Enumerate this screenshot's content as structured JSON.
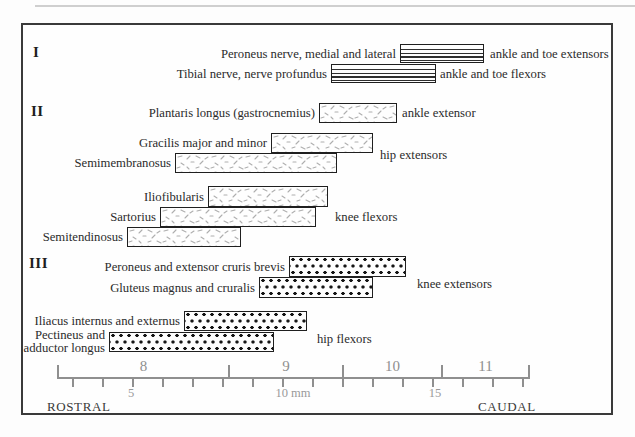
{
  "figure": {
    "frame": {
      "x": 21,
      "y": 23,
      "w": 592,
      "h": 392
    },
    "colors": {
      "frame_border": "#3a3a3a",
      "bar_border": "#1f1f1f",
      "stripe_line": "#2f2f2f",
      "speckle_stroke": "#aeaeae",
      "dot_fill": "#161616",
      "axis_gray": "#8f8f8f",
      "text": "#2b2b2b"
    }
  },
  "chart_data": {
    "type": "bar",
    "orientation": "horizontal-span",
    "title": "",
    "xlabel": "mm",
    "axis": {
      "unit": "mm",
      "mm_start": 3,
      "mm_end": 18,
      "px_origin_x": 73,
      "px_per_mm": 30,
      "line_y": 378,
      "minor_tick_step_mm": 1,
      "mm_labels": [
        {
          "text": "5",
          "mm": 5,
          "dx": -2
        },
        {
          "text": "10 mm",
          "mm": 10,
          "dx": 10
        },
        {
          "text": "15",
          "mm": 15,
          "dx": 2
        }
      ],
      "segment_boundaries_mm": [
        2.5,
        8.2,
        12.0,
        15.3,
        18.2
      ],
      "segment_labels": [
        "8",
        "9",
        "10",
        "11"
      ],
      "rostral_label": "ROSTRAL",
      "caudal_label": "CAUDAL",
      "rostral_x": 47,
      "caudal_x": 478,
      "end_label_y": 399
    },
    "groups": [
      {
        "numeral": "I",
        "pattern": "stripes",
        "x": 33,
        "y": 52
      },
      {
        "numeral": "II",
        "pattern": "speckle",
        "x": 31,
        "y": 111
      },
      {
        "numeral": "III",
        "pattern": "dots",
        "x": 29,
        "y": 263
      }
    ],
    "bars": [
      {
        "label": "Peroneus nerve, medial and lateral",
        "group": "I",
        "start_mm": 13.9,
        "end_mm": 16.7,
        "y": 44,
        "h": 19
      },
      {
        "label": "Tibial nerve, nerve profundus",
        "group": "I",
        "start_mm": 11.6,
        "end_mm": 15.1,
        "y": 64,
        "h": 19
      },
      {
        "label": "Plantaris longus (gastrocnemius)",
        "group": "II",
        "start_mm": 11.2,
        "end_mm": 13.8,
        "y": 103,
        "h": 20
      },
      {
        "label": "Gracilis major and minor",
        "group": "II",
        "start_mm": 9.6,
        "end_mm": 13.0,
        "y": 133,
        "h": 20
      },
      {
        "label": "Semimembranosus",
        "group": "II",
        "start_mm": 6.4,
        "end_mm": 11.8,
        "y": 153,
        "h": 20
      },
      {
        "label": "Iliofibularis",
        "group": "II",
        "start_mm": 7.5,
        "end_mm": 11.5,
        "y": 186,
        "h": 21
      },
      {
        "label": "Sartorius",
        "group": "II",
        "start_mm": 5.9,
        "end_mm": 11.1,
        "y": 207,
        "h": 20
      },
      {
        "label": "Semitendinosus",
        "group": "II",
        "start_mm": 4.8,
        "end_mm": 8.6,
        "y": 227,
        "h": 20
      },
      {
        "label": "Peroneus and extensor cruris brevis",
        "group": "III",
        "start_mm": 10.2,
        "end_mm": 14.1,
        "y": 256,
        "h": 21
      },
      {
        "label": "Gluteus magnus and cruralis",
        "group": "III",
        "start_mm": 9.2,
        "end_mm": 13.0,
        "y": 277,
        "h": 21
      },
      {
        "label": "Iliacus internus and externus",
        "group": "III",
        "start_mm": 6.7,
        "end_mm": 10.8,
        "y": 311,
        "h": 20
      },
      {
        "label": "Pectineus and\nadductor longus",
        "group": "III",
        "start_mm": 4.2,
        "end_mm": 9.7,
        "y": 332,
        "h": 20
      }
    ],
    "function_labels": [
      {
        "text": "ankle and toe extensors",
        "x": 490,
        "y": 54
      },
      {
        "text": "ankle and toe flexors",
        "x": 440,
        "y": 74
      },
      {
        "text": "ankle extensor",
        "x": 402,
        "y": 113
      },
      {
        "text": "hip extensors",
        "x": 380,
        "y": 155
      },
      {
        "text": "knee flexors",
        "x": 335,
        "y": 217
      },
      {
        "text": "knee extensors",
        "x": 417,
        "y": 284
      },
      {
        "text": "hip flexors",
        "x": 317,
        "y": 339
      }
    ]
  }
}
